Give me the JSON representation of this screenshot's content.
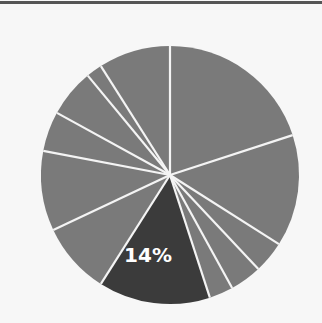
{
  "chart_data": {
    "type": "pie",
    "title": "",
    "slices": [
      {
        "value": 20,
        "label": "",
        "highlighted": false
      },
      {
        "value": 14,
        "label": "",
        "highlighted": false
      },
      {
        "value": 4,
        "label": "",
        "highlighted": false
      },
      {
        "value": 4,
        "label": "",
        "highlighted": false
      },
      {
        "value": 3,
        "label": "",
        "highlighted": false
      },
      {
        "value": 14,
        "label": "14%",
        "highlighted": true
      },
      {
        "value": 9,
        "label": "",
        "highlighted": false
      },
      {
        "value": 10,
        "label": "",
        "highlighted": false
      },
      {
        "value": 5,
        "label": "",
        "highlighted": false
      },
      {
        "value": 6,
        "label": "",
        "highlighted": false
      },
      {
        "value": 2,
        "label": "",
        "highlighted": false
      },
      {
        "value": 9,
        "label": "",
        "highlighted": false
      }
    ],
    "start_angle_deg": 0,
    "direction": "clockwise",
    "legend": null
  },
  "colors": {
    "slice": "#7a7a7a",
    "highlight": "#3b3b3b",
    "separator": "#f4f4f4",
    "background": "#f7f7f7",
    "top_rule": "#555555"
  },
  "highlight_label": "14%"
}
